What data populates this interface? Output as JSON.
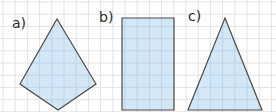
{
  "figure": {
    "grid": {
      "spacing": 12.2,
      "offset_x": 3,
      "offset_y": 2,
      "color": "#e3e3e3"
    },
    "fill_color": "#d3e7f7",
    "stroke_color": "#4a4a4a",
    "inner_grid_color": "#bcd3e6",
    "shapes": [
      {
        "label": "a)",
        "name": "kite",
        "label_pos": [
          12,
          16
        ],
        "points": [
          [
            57,
            19
          ],
          [
            96,
            84
          ],
          [
            58,
            110
          ],
          [
            20,
            84
          ]
        ]
      },
      {
        "label": "b)",
        "name": "rectangle",
        "label_pos": [
          99,
          10
        ],
        "points": [
          [
            122,
            18
          ],
          [
            174,
            18
          ],
          [
            174,
            110
          ],
          [
            122,
            110
          ]
        ]
      },
      {
        "label": "c)",
        "name": "isosceles-triangle",
        "label_pos": [
          188,
          9
        ],
        "points": [
          [
            225,
            18
          ],
          [
            262,
            110
          ],
          [
            188,
            110
          ]
        ]
      }
    ]
  }
}
